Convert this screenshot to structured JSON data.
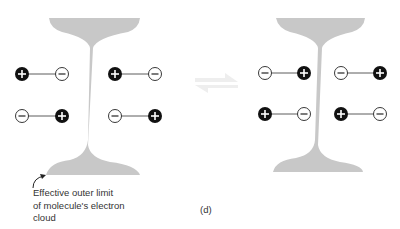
{
  "diagram": {
    "caption_lines": [
      "Effective outer limit",
      "of molecule's electron",
      "cloud"
    ],
    "panel_label": "(d)",
    "colors": {
      "cloud": "#c8c8c8",
      "positive_fill": "#111111",
      "negative_fill": "#ffffff",
      "arrow": "#f2f2f2"
    },
    "left_molecule": {
      "dipoles": [
        {
          "row": "top",
          "side": "left",
          "order": [
            "+",
            "-"
          ]
        },
        {
          "row": "top",
          "side": "right",
          "order": [
            "+",
            "-"
          ]
        },
        {
          "row": "bottom",
          "side": "left",
          "order": [
            "-",
            "+"
          ]
        },
        {
          "row": "bottom",
          "side": "right",
          "order": [
            "-",
            "+"
          ]
        }
      ]
    },
    "right_molecule": {
      "dipoles": [
        {
          "row": "top",
          "side": "left",
          "order": [
            "-",
            "+"
          ]
        },
        {
          "row": "top",
          "side": "right",
          "order": [
            "-",
            "+"
          ]
        },
        {
          "row": "bottom",
          "side": "left",
          "order": [
            "+",
            "-"
          ]
        },
        {
          "row": "bottom",
          "side": "right",
          "order": [
            "+",
            "-"
          ]
        }
      ]
    },
    "equilibrium_arrow": "equilibrium-arrows-icon"
  }
}
